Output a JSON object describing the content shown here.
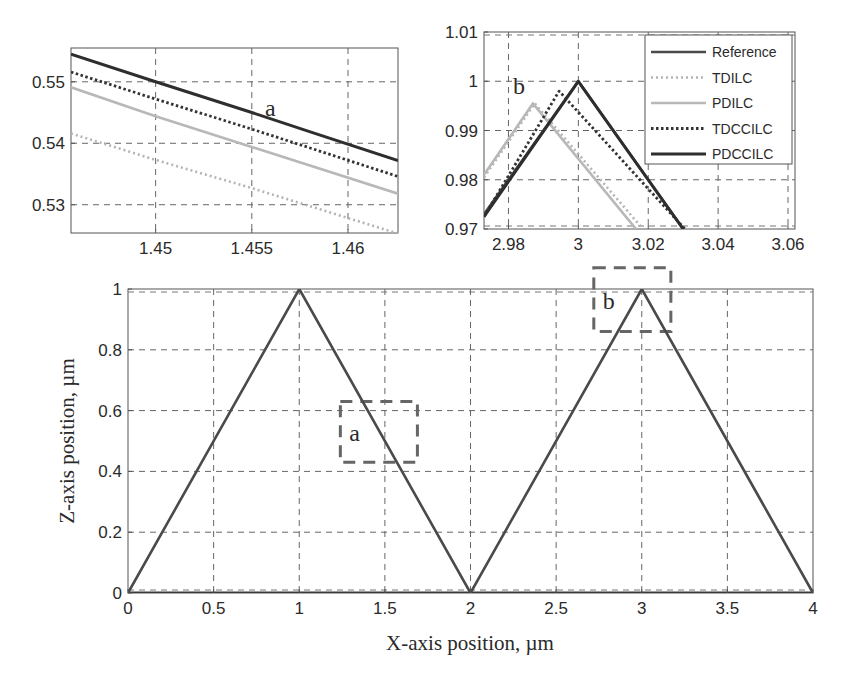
{
  "chart_data": [
    {
      "id": "main",
      "type": "line",
      "title": "",
      "xlabel": "X-axis position, µm",
      "ylabel": "Z-axis position, µm",
      "xlim": [
        0,
        4
      ],
      "ylim": [
        0,
        1
      ],
      "xticks": [
        0,
        0.5,
        1,
        1.5,
        2,
        2.5,
        3,
        3.5,
        4
      ],
      "xtick_labels": [
        "0",
        "0.5",
        "1",
        "1.5",
        "2",
        "2.5",
        "3",
        "3.5",
        "4"
      ],
      "yticks": [
        0,
        0.2,
        0.4,
        0.6,
        0.8,
        1
      ],
      "ytick_labels": [
        "0",
        "0.2",
        "0.4",
        "0.6",
        "0.8",
        "1"
      ],
      "grid": true,
      "series": [
        {
          "name": "Reference",
          "x": [
            0,
            1,
            2,
            3,
            4
          ],
          "y": [
            0,
            1,
            0,
            1,
            0
          ]
        },
        {
          "name": "Baseline",
          "x": [
            0,
            4
          ],
          "y": [
            0,
            0
          ]
        }
      ],
      "annotations": [
        {
          "label": "a",
          "box": {
            "x0": 1.24,
            "x1": 1.69,
            "y0": 0.43,
            "y1": 0.63
          }
        },
        {
          "label": "b",
          "box": {
            "x0": 2.72,
            "x1": 3.17,
            "y0": 0.86,
            "y1": 1.07
          }
        }
      ]
    },
    {
      "id": "inset_a",
      "type": "line",
      "label": "a",
      "xlim": [
        1.4456,
        1.4626
      ],
      "ylim": [
        0.5254,
        0.5555
      ],
      "xticks": [
        1.45,
        1.455,
        1.46
      ],
      "xtick_labels": [
        "1.45",
        "1.455",
        "1.46"
      ],
      "yticks": [
        0.53,
        0.54,
        0.55
      ],
      "ytick_labels": [
        "0.53",
        "0.54",
        "0.55"
      ],
      "grid": true,
      "series": [
        {
          "name": "PDCCILC",
          "x": [
            1.4456,
            1.45,
            1.455,
            1.458,
            1.4626
          ],
          "y": [
            0.5545,
            0.55,
            0.545,
            0.5419,
            0.5372
          ]
        },
        {
          "name": "TDCCILC",
          "x": [
            1.4456,
            1.45,
            1.455,
            1.4626
          ],
          "y": [
            0.5516,
            0.5472,
            0.5423,
            0.5346
          ]
        },
        {
          "name": "PDILC",
          "x": [
            1.4456,
            1.45,
            1.455,
            1.4626
          ],
          "y": [
            0.5491,
            0.5444,
            0.5394,
            0.5318
          ]
        },
        {
          "name": "TDILC",
          "x": [
            1.4456,
            1.45,
            1.455,
            1.4626
          ],
          "y": [
            0.5416,
            0.5373,
            0.5327,
            0.5253
          ]
        }
      ]
    },
    {
      "id": "inset_b",
      "type": "line",
      "label": "b",
      "xlim": [
        2.973,
        3.062
      ],
      "ylim": [
        0.97,
        1.01
      ],
      "xticks": [
        2.98,
        3,
        3.02,
        3.04,
        3.06
      ],
      "xtick_labels": [
        "2.98",
        "3",
        "3.02",
        "3.04",
        "3.06"
      ],
      "yticks": [
        0.97,
        0.98,
        0.99,
        1,
        1.01
      ],
      "ytick_labels": [
        "0.97",
        "0.98",
        "0.99",
        "1",
        "1.01"
      ],
      "grid": true,
      "legend": {
        "position": "upper right",
        "entries": [
          "Reference",
          "TDILC",
          "PDILC",
          "TDCCILC",
          "PDCCILC"
        ]
      },
      "series": [
        {
          "name": "Reference",
          "x": [
            2.973,
            3.0,
            3.03
          ],
          "y": [
            0.973,
            1.0,
            0.97
          ]
        },
        {
          "name": "TDILC",
          "x": [
            2.973,
            2.9875,
            3.0185
          ],
          "y": [
            0.9805,
            0.9955,
            0.97
          ]
        },
        {
          "name": "PDILC",
          "x": [
            2.973,
            2.987,
            3.0165
          ],
          "y": [
            0.981,
            0.9955,
            0.97
          ]
        },
        {
          "name": "TDCCILC",
          "x": [
            2.973,
            2.9945,
            3.0305
          ],
          "y": [
            0.9725,
            0.998,
            0.97
          ]
        },
        {
          "name": "PDCCILC",
          "x": [
            2.973,
            3.0,
            3.03
          ],
          "y": [
            0.9725,
            1.0,
            0.97
          ]
        }
      ]
    }
  ],
  "styles": {
    "Reference": {
      "color": "#4a4a4a",
      "width": 2.6,
      "dash": ""
    },
    "TDILC": {
      "color": "#b4b4b4",
      "width": 2.6,
      "dash": "2 3"
    },
    "PDILC": {
      "color": "#b8b8b8",
      "width": 2.6,
      "dash": ""
    },
    "TDCCILC": {
      "color": "#333333",
      "width": 2.8,
      "dash": "2.5 2.5"
    },
    "PDCCILC": {
      "color": "#2e2e2e",
      "width": 3,
      "dash": ""
    },
    "Baseline": {
      "color": "#3a3a3a",
      "width": 3,
      "dash": ""
    }
  },
  "labels": {
    "main_xlabel": "X-axis position, µm",
    "main_ylabel": "Z-axis position, µm",
    "inset_a_letter": "a",
    "inset_b_letter": "b",
    "box_a_letter": "a",
    "box_b_letter": "b",
    "legend": [
      "Reference",
      "TDILC",
      "PDILC",
      "TDCCILC",
      "PDCCILC"
    ]
  }
}
